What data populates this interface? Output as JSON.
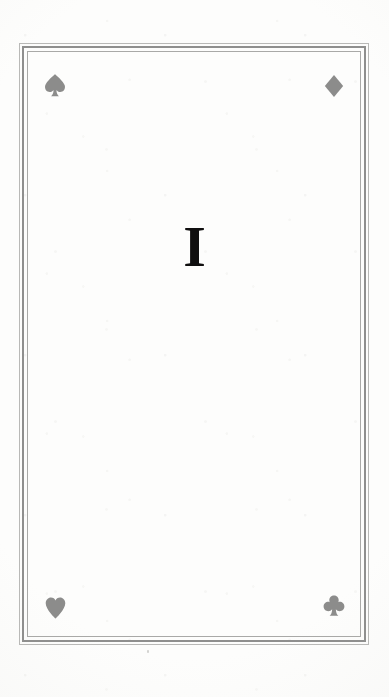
{
  "page": {
    "kind": "book-part-divider",
    "background_color": "#fdfdfc",
    "numeral": "I",
    "numeral_color": "#100f0f"
  },
  "frame": {
    "style": "triple-rule",
    "outer_rule_color": "#b9b9b7",
    "middle_rule_color": "#8f8f8e",
    "inner_rule_color": "#a9a9a7"
  },
  "ornaments": {
    "color": "#8c8c8b",
    "corners": [
      {
        "position": "top-left",
        "icon": "spade-icon",
        "glyph": "♠",
        "label": "Spade"
      },
      {
        "position": "top-right",
        "icon": "diamond-icon",
        "glyph": "♦",
        "label": "Diamond"
      },
      {
        "position": "bottom-left",
        "icon": "heart-icon",
        "glyph": "♥",
        "label": "Heart"
      },
      {
        "position": "bottom-right",
        "icon": "club-icon",
        "glyph": "♣",
        "label": "Club"
      }
    ]
  }
}
